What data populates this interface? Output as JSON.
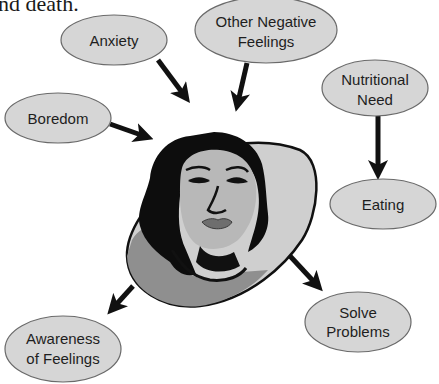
{
  "caption": "nd death.",
  "diagram": {
    "center_figure": "woman-face-illustration",
    "nodes": [
      {
        "id": "anxiety",
        "lines": [
          "Anxiety"
        ]
      },
      {
        "id": "other_negative_feelings",
        "lines": [
          "Other Negative",
          "Feelings"
        ]
      },
      {
        "id": "boredom",
        "lines": [
          "Boredom"
        ]
      },
      {
        "id": "nutritional_need",
        "lines": [
          "Nutritional",
          "Need"
        ]
      },
      {
        "id": "eating",
        "lines": [
          "Eating"
        ]
      },
      {
        "id": "solve_problems",
        "lines": [
          "Solve",
          "Problems"
        ]
      },
      {
        "id": "awareness_of_feelings",
        "lines": [
          "Awareness",
          "of Feelings"
        ]
      }
    ],
    "edges": [
      {
        "from": "anxiety",
        "to": "center"
      },
      {
        "from": "other_negative_feelings",
        "to": "center"
      },
      {
        "from": "boredom",
        "to": "center"
      },
      {
        "from": "nutritional_need",
        "to": "eating"
      },
      {
        "from": "center",
        "to": "solve_problems"
      },
      {
        "from": "center",
        "to": "awareness_of_feelings"
      }
    ],
    "colors": {
      "node_fill": "#d6d6d6",
      "node_stroke": "#6a6a6a",
      "arrow": "#111111",
      "blob_fill": "#cfcfcf",
      "shirt": "#8a8a8a",
      "hair": "#0d0d0d",
      "skin": "#b8b8b8"
    }
  }
}
